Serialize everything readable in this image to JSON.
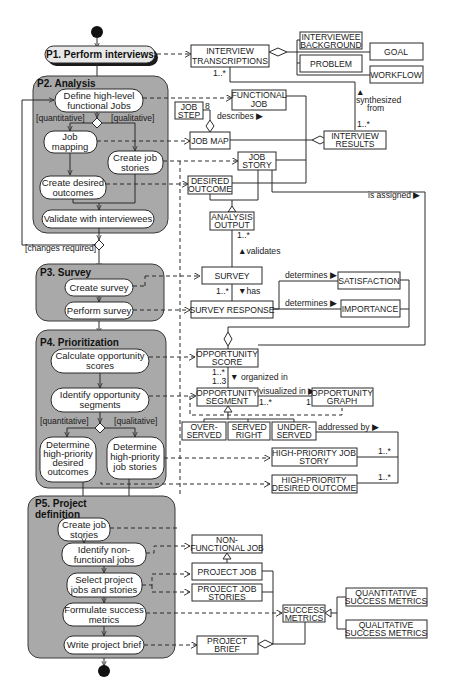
{
  "diagram": {
    "type": "UML activity diagram with associated class model",
    "start_node": "initial-node",
    "end_node": "final-node",
    "phases": [
      {
        "id": "p1",
        "title": "P1. Perform interviews",
        "activities": []
      },
      {
        "id": "p2",
        "title": "P2. Analysis",
        "activities": [
          {
            "id": "a_define",
            "label_lines": [
              "Define high-level",
              "functional Jobs"
            ]
          },
          {
            "id": "a_jobmap",
            "label_lines": [
              "Job",
              "mapping"
            ]
          },
          {
            "id": "a_jobstories",
            "label_lines": [
              "Create job",
              "stories"
            ]
          },
          {
            "id": "a_outcomes",
            "label_lines": [
              "Create desired",
              "outcomes"
            ]
          },
          {
            "id": "a_validate",
            "label_lines": [
              "Validate with interviewees"
            ]
          }
        ],
        "guards": [
          "[quantitative]",
          "[qualitative]"
        ],
        "loop_guard": "[changes required]"
      },
      {
        "id": "p3",
        "title": "P3. Survey",
        "activities": [
          {
            "id": "a_createsurvey",
            "label_lines": [
              "Create survey"
            ]
          },
          {
            "id": "a_performsurvey",
            "label_lines": [
              "Perform survey"
            ]
          }
        ]
      },
      {
        "id": "p4",
        "title": "P4. Prioritization",
        "activities": [
          {
            "id": "a_calc",
            "label_lines": [
              "Calculate opportunity",
              "scores"
            ]
          },
          {
            "id": "a_identify",
            "label_lines": [
              "Identify opportunity",
              "segments"
            ]
          },
          {
            "id": "a_hpoutcomes",
            "label_lines": [
              "Determine",
              "high-priority",
              "desired",
              "outcomes"
            ]
          },
          {
            "id": "a_hpstories",
            "label_lines": [
              "Determine",
              "high-priority",
              "job stories"
            ]
          }
        ],
        "guards": [
          "[quantitative]",
          "[qualitative]"
        ]
      },
      {
        "id": "p5",
        "title_lines": [
          "P5. Project",
          "definition"
        ],
        "activities": [
          {
            "id": "a_p5stories",
            "label_lines": [
              "Create job",
              "stories"
            ]
          },
          {
            "id": "a_nonfunc",
            "label_lines": [
              "Identify non-",
              "functional jobs"
            ]
          },
          {
            "id": "a_select",
            "label_lines": [
              "Select project",
              "jobs and stories"
            ]
          },
          {
            "id": "a_metrics",
            "label_lines": [
              "Formulate success",
              "metrics"
            ]
          },
          {
            "id": "a_brief",
            "label_lines": [
              "Write project brief"
            ]
          }
        ]
      }
    ],
    "classes": {
      "interview_transcriptions": [
        "INTERVIEW",
        "TRANSCRIPTIONS"
      ],
      "interviewee_background": [
        "INTERVIEWEE",
        "BACKGROUND"
      ],
      "goal": [
        "GOAL"
      ],
      "problem": [
        "PROBLEM"
      ],
      "workflow": [
        "WORKFLOW"
      ],
      "functional_job": [
        "FUNCTIONAL",
        "JOB"
      ],
      "job_step": [
        "JOB",
        "STEP"
      ],
      "job_map": [
        "JOB MAP"
      ],
      "interview_results": [
        "INTERVIEW",
        "RESULTS"
      ],
      "job_story": [
        "JOB",
        "STORY"
      ],
      "desired_outcome": [
        "DESIRED",
        "OUTCOME"
      ],
      "analysis_output": [
        "ANALYSIS",
        "OUTPUT"
      ],
      "survey": [
        "SURVEY"
      ],
      "survey_response": [
        "SURVEY RESPONSE"
      ],
      "satisfaction": [
        "SATISFACTION"
      ],
      "importance": [
        "IMPORTANCE"
      ],
      "opportunity_score": [
        "OPPORTUNITY",
        "SCORE"
      ],
      "opportunity_segment": [
        "OPPORTUNITY",
        "SEGMENT"
      ],
      "opportunity_graph": [
        "OPPORTUNITY",
        "GRAPH"
      ],
      "over_served": [
        "OVER-",
        "SERVED"
      ],
      "served_right": [
        "SERVED",
        "RIGHT"
      ],
      "under_served": [
        "UNDER-",
        "SERVED"
      ],
      "hp_job_story": [
        "HIGH-PRIORITY JOB",
        "STORY"
      ],
      "hp_desired_outcome": [
        "HIGH-PRIORITY",
        "DESIRED OUTCOME"
      ],
      "non_functional_job": [
        "NON-",
        "FUNCTIONAL JOB"
      ],
      "project_job": [
        "PROJECT JOB"
      ],
      "project_job_stories": [
        "PROJECT JOB",
        "STORIES"
      ],
      "success_metrics": [
        "SUCCESS",
        "METRICS"
      ],
      "quantitative_metrics": [
        "QUANTITATIVE",
        "SUCCESS METRICS"
      ],
      "qualitative_metrics": [
        "QUALITATIVE",
        "SUCCESS METRICS"
      ],
      "project_brief": [
        "PROJECT",
        "BRIEF"
      ]
    },
    "association_labels": {
      "synthesized_from": [
        "▲",
        "synthesized",
        "from"
      ],
      "describes": "describes ▶",
      "is_assigned": "is assigned ▶",
      "validates": "▲validates",
      "has": "▼has",
      "determines_satisfaction": "determines ▶",
      "determines_importance": "determines ▶",
      "organized_in": "▼ organized in",
      "visualized_in": "visualized in ▶",
      "addressed_by": "addressed by ▶"
    },
    "multiplicities": {
      "transcriptions": "1..*",
      "results": "1..*",
      "job_step": "8",
      "analysis_output": "1..*",
      "survey": "1..*",
      "score": "1..*",
      "segment_top": "1..3",
      "segment_right": "1..*",
      "graph": "1",
      "hp_story": "1..*",
      "hp_outcome": "1..*"
    }
  }
}
